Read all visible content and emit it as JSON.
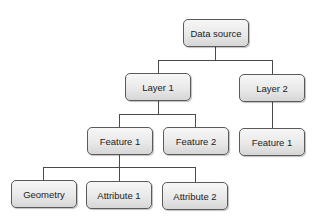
{
  "diagram": {
    "type": "tree",
    "colors": {
      "node_fill_top": "#f7f7f7",
      "node_fill_bottom": "#d6d6d6",
      "node_border": "#5a5a5a",
      "connector": "#4a4a4a",
      "text": "#222222"
    },
    "nodes": {
      "root": {
        "label": "Data source"
      },
      "layer1": {
        "label": "Layer 1"
      },
      "layer2": {
        "label": "Layer 2"
      },
      "layer1_feature1": {
        "label": "Feature 1"
      },
      "layer1_feature2": {
        "label": "Feature 2"
      },
      "layer2_feature1": {
        "label": "Feature 1"
      },
      "geometry": {
        "label": "Geometry"
      },
      "attribute1": {
        "label": "Attribute 1"
      },
      "attribute2": {
        "label": "Attribute 2"
      }
    },
    "edges": [
      [
        "root",
        "layer1"
      ],
      [
        "root",
        "layer2"
      ],
      [
        "layer1",
        "layer1_feature1"
      ],
      [
        "layer1",
        "layer1_feature2"
      ],
      [
        "layer2",
        "layer2_feature1"
      ],
      [
        "layer1_feature1",
        "geometry"
      ],
      [
        "layer1_feature1",
        "attribute1"
      ],
      [
        "layer1_feature1",
        "attribute2"
      ]
    ]
  }
}
